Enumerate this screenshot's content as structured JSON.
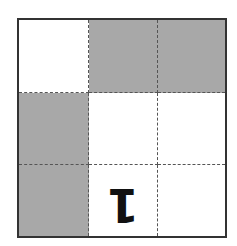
{
  "puzzle": {
    "rows": 3,
    "cols": 3,
    "colors": {
      "shaded": "#a8a8a8",
      "empty": "#ffffff",
      "border": "#333333",
      "gridline": "#555555",
      "glyph": "#111111"
    },
    "cells": [
      [
        {
          "state": "empty",
          "value": ""
        },
        {
          "state": "shaded",
          "value": ""
        },
        {
          "state": "shaded",
          "value": ""
        }
      ],
      [
        {
          "state": "shaded",
          "value": ""
        },
        {
          "state": "empty",
          "value": ""
        },
        {
          "state": "empty",
          "value": ""
        }
      ],
      [
        {
          "state": "shaded",
          "value": ""
        },
        {
          "state": "empty",
          "value": "1",
          "rotated": "180deg"
        },
        {
          "state": "empty",
          "value": ""
        }
      ]
    ]
  }
}
